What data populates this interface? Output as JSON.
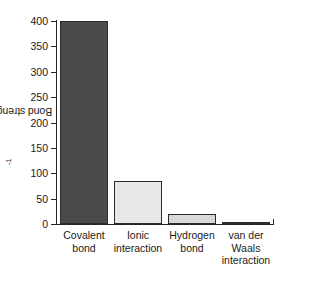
{
  "chart_data": {
    "type": "bar",
    "title": "",
    "xlabel": "",
    "ylabel": "Bond strength (kJ · mol",
    "ylabel_sup": "-1",
    "ylabel_close": ")",
    "ylabel_full": "Bond strength (kJ · mol⁻¹)",
    "categories": [
      "Covalent\nbond",
      "Ionic\ninteraction",
      "Hydrogen\nbond",
      "van der\nWaals\ninteraction"
    ],
    "values": [
      400,
      85,
      20,
      4
    ],
    "bar_colors": [
      "#4a4a4a",
      "#e8e8e8",
      "#d9d9d9",
      "#4a4a4a"
    ],
    "bar_edge_color": "#2b2b2b",
    "ylim": [
      0,
      400
    ],
    "yticks": [
      0,
      50,
      100,
      150,
      200,
      250,
      300,
      350,
      400
    ],
    "ytick_labels": [
      "0",
      "50",
      "100",
      "150",
      "200",
      "250",
      "300",
      "350",
      "400"
    ],
    "grid": false,
    "legend": false,
    "axis_color": "#262626",
    "text_color": "#1a1a1a",
    "background": "#ffffff"
  }
}
